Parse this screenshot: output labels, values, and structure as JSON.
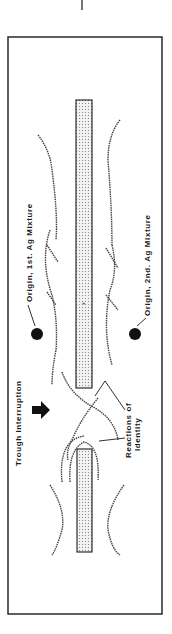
{
  "labels": {
    "origin_first": "Origin, 1st. Ag Mixture",
    "origin_second": "Origin, 2nd. Ag Mixture",
    "trough_interruption": "Trough Interruption",
    "reactions_line1": "Reactions of",
    "reactions_line2": "Identity"
  },
  "colors": {
    "ink": "#1a1a1a",
    "trough_fill": "#e6e6e6",
    "background": "#ffffff"
  }
}
